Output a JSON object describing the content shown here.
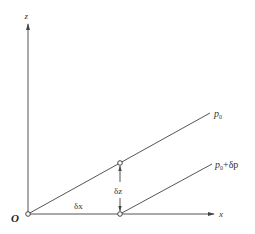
{
  "diagram": {
    "axes": {
      "vertical_label": "z",
      "horizontal_label": "x",
      "origin_label": "O"
    },
    "lines": [
      {
        "label_base": "p",
        "label_sub": "0",
        "label_suffix": ""
      },
      {
        "label_base": "p",
        "label_sub": "0",
        "label_suffix": "+δp"
      }
    ],
    "annotations": {
      "dx": "δx",
      "dz": "δz"
    },
    "colors": {
      "stroke": "#555555",
      "text": "#333333",
      "background": "#ffffff"
    }
  }
}
